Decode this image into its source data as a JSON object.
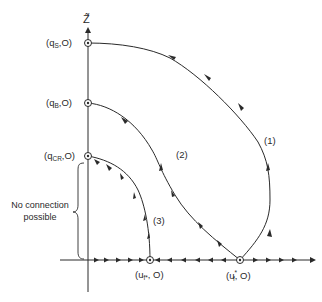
{
  "diagram": {
    "type": "phase-plane",
    "axes": {
      "vertical_label": "Z̃",
      "horizontal_label": ""
    },
    "vertical_points": [
      {
        "id": "qS",
        "prefix": "(q",
        "sub": "S",
        "suffix": ",O)"
      },
      {
        "id": "qB",
        "prefix": "(q",
        "sub": "B",
        "suffix": ",O)"
      },
      {
        "id": "qCR",
        "prefix": "(q",
        "sub": "CR",
        "suffix": ",O)"
      }
    ],
    "horizontal_points": [
      {
        "id": "uf_star_sub",
        "prefix": "(u",
        "sub": "f*",
        "suffix": ", O)"
      },
      {
        "id": "uf_star_sup",
        "prefix": "(u",
        "sup": "*",
        "sub": "f",
        "suffix": ", O)"
      }
    ],
    "trajectories": [
      {
        "label": "(1)",
        "from": "(u_f^*,0)",
        "to": "(q_S,0)"
      },
      {
        "label": "(2)",
        "from": "(u_f^*,0)",
        "to": "(q_B,0)"
      },
      {
        "label": "(3)",
        "from": "(u_f*,0)",
        "to": "(q_CR,0)"
      }
    ],
    "annotation": {
      "line1": "No connection",
      "line2": "possible"
    }
  }
}
